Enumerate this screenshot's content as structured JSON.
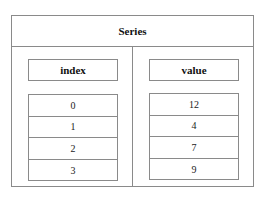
{
  "diagram": {
    "title": "Series",
    "columns": [
      {
        "header": "index",
        "cells": [
          "0",
          "1",
          "2",
          "3"
        ]
      },
      {
        "header": "value",
        "cells": [
          "12",
          "4",
          "7",
          "9"
        ]
      }
    ]
  },
  "colors": {
    "border": "#8a8a8a",
    "background": "#ffffff",
    "text": "#111111"
  }
}
